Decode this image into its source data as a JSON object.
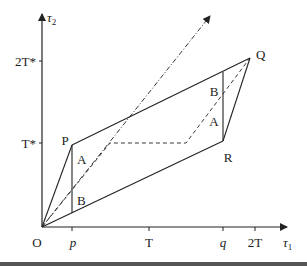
{
  "diagram": {
    "axes": {
      "x_label": "τ",
      "x_label_sub": "1",
      "y_label": "τ",
      "y_label_sub": "2",
      "origin_label": "O",
      "x_ticks": [
        "p",
        "T",
        "q",
        "2T"
      ],
      "y_ticks": [
        "2T*",
        "T*"
      ]
    },
    "points": {
      "P": "P",
      "Q": "Q",
      "R": "R"
    },
    "regions": {
      "left_upper": "A",
      "left_lower": "B",
      "right_upper": "B",
      "right_lower": "A"
    },
    "colors": {
      "line": "#222222",
      "background": "#ffffff"
    }
  }
}
